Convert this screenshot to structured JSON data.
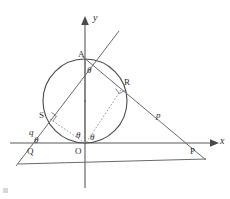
{
  "figure": {
    "background_color": "#ffffff",
    "stroke_color": "#5a5a5a",
    "label_color": "#2e2e2e"
  },
  "axes": {
    "x_label": "x",
    "y_label": "y",
    "origin_label": "O"
  },
  "points": [
    {
      "id": "A",
      "label": "A",
      "x": 85,
      "y": 59
    },
    {
      "id": "R",
      "label": "R",
      "x": 122,
      "y": 88
    },
    {
      "id": "S",
      "label": "S",
      "x": 48,
      "y": 117
    },
    {
      "id": "Q",
      "label": "Q",
      "x": 32,
      "y": 147
    },
    {
      "id": "P",
      "label": "P",
      "x": 193,
      "y": 143
    },
    {
      "id": "O",
      "label": "O",
      "x": 85,
      "y": 143
    }
  ],
  "segments": [
    {
      "id": "p",
      "label": "p",
      "from": "R",
      "to": "P"
    },
    {
      "id": "q",
      "label": "q",
      "from": "Q",
      "to": "S"
    }
  ],
  "angles": [
    {
      "id": "theta-at-A",
      "label": "θ",
      "vertex": "A"
    },
    {
      "id": "theta-at-Q",
      "label": "θ",
      "vertex": "Q"
    },
    {
      "id": "theta-at-O-left",
      "label": "θ",
      "vertex": "O"
    },
    {
      "id": "theta-at-O-right",
      "label": "θ",
      "vertex": "O"
    }
  ],
  "right_angles": [
    {
      "id": "right-angle-at-S",
      "vertex": "S"
    },
    {
      "id": "right-angle-at-R",
      "vertex": "R"
    }
  ],
  "circle": {
    "center_x": 85,
    "center_y": 101,
    "radius": 42,
    "tangent_point": "O",
    "top_point": "A"
  }
}
